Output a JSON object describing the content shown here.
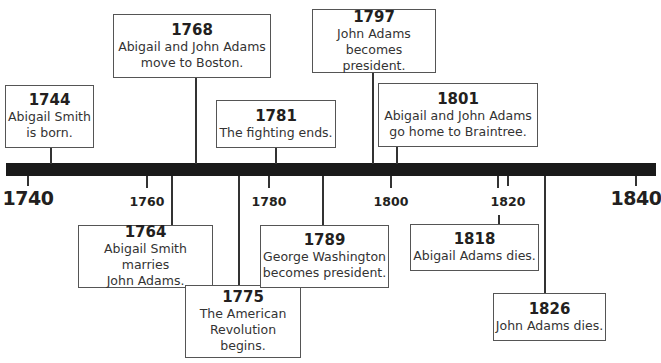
{
  "timeline": {
    "start_year": 1740,
    "end_year": 1840,
    "ticks": [
      {
        "label": "1740",
        "year": 1740,
        "major": true
      },
      {
        "label": "1760",
        "year": 1760,
        "major": false
      },
      {
        "label": "1780",
        "year": 1780,
        "major": false
      },
      {
        "label": "1800",
        "year": 1800,
        "major": false
      },
      {
        "label": "1820",
        "year": 1820,
        "major": false
      },
      {
        "label": "1840",
        "year": 1840,
        "major": true
      }
    ],
    "bar_color": "#1a1a1a"
  },
  "events": [
    {
      "year": "1744",
      "lines": [
        "Abigail Smith",
        "is born."
      ],
      "position": "above"
    },
    {
      "year": "1768",
      "lines": [
        "Abigail and John Adams",
        "move to Boston."
      ],
      "position": "above"
    },
    {
      "year": "1781",
      "lines": [
        "The fighting ends."
      ],
      "position": "above"
    },
    {
      "year": "1797",
      "lines": [
        "John Adams",
        "becomes president."
      ],
      "position": "above"
    },
    {
      "year": "1801",
      "lines": [
        "Abigail and John Adams",
        "go home to Braintree."
      ],
      "position": "above"
    },
    {
      "year": "1764",
      "lines": [
        "Abigail Smith marries",
        "John Adams."
      ],
      "position": "below"
    },
    {
      "year": "1775",
      "lines": [
        "The American",
        "Revolution begins."
      ],
      "position": "below"
    },
    {
      "year": "1789",
      "lines": [
        "George Washington",
        "becomes president."
      ],
      "position": "below"
    },
    {
      "year": "1818",
      "lines": [
        "Abigail Adams dies."
      ],
      "position": "below"
    },
    {
      "year": "1826",
      "lines": [
        "John Adams dies."
      ],
      "position": "below"
    }
  ]
}
